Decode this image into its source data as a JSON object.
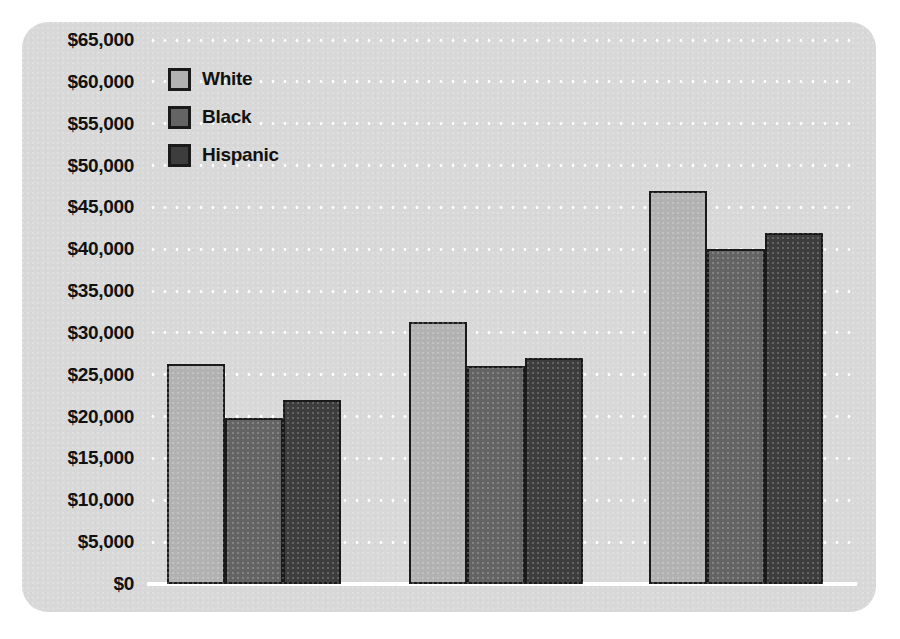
{
  "chart_data": {
    "type": "bar",
    "title": "",
    "subtitle": "",
    "xlabel": "",
    "ylabel": "",
    "categories": [
      "Less than High School",
      "High School Graduate",
      "Bachelor's Degree"
    ],
    "series": [
      {
        "name": "White",
        "color": "#b2b2b2",
        "values": [
          26300,
          31300,
          47000
        ]
      },
      {
        "name": "Black",
        "color": "#646464",
        "values": [
          19800,
          26000,
          40000
        ]
      },
      {
        "name": "Hispanic",
        "color": "#3d3d3d",
        "values": [
          22000,
          27000,
          42000
        ]
      }
    ],
    "ylim": [
      0,
      65000
    ],
    "ytick_step": 5000,
    "ytick_labels": [
      "$65,000",
      "$60,000",
      "$55,000",
      "$50,000",
      "$45,000",
      "$40,000",
      "$35,000",
      "$30,000",
      "$25,000",
      "$20,000",
      "$15,000",
      "$10,000",
      "$5,000",
      "$0"
    ],
    "ytick_values": [
      65000,
      60000,
      55000,
      50000,
      45000,
      40000,
      35000,
      30000,
      25000,
      20000,
      15000,
      10000,
      5000,
      0
    ],
    "grid": true,
    "grid_style": "dotted-white-horizontal",
    "legend_position": "top-left",
    "background_color": "#d8d8d8",
    "bar_outline_color": "#1a1a1a"
  }
}
